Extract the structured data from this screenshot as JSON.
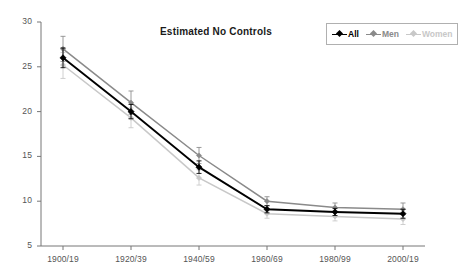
{
  "chart_data": {
    "type": "line",
    "title": "Estimated No Controls",
    "xlabel": "",
    "ylabel": "",
    "categories": [
      "1900/19",
      "1920/39",
      "1940/59",
      "1960/69",
      "1980/99",
      "2000/19"
    ],
    "ylim": [
      5,
      30
    ],
    "yticks": [
      5,
      10,
      15,
      20,
      25,
      30
    ],
    "grid": false,
    "legend_position": "top-right",
    "error_bars": true,
    "series": [
      {
        "name": "All",
        "color": "#000000",
        "values": [
          26.0,
          20.0,
          13.8,
          9.1,
          8.8,
          8.6
        ],
        "err_low": [
          24.9,
          19.2,
          13.1,
          8.7,
          8.4,
          8.1
        ],
        "err_high": [
          27.1,
          20.8,
          14.5,
          9.5,
          9.2,
          9.1
        ]
      },
      {
        "name": "Men",
        "color": "#8a8a8a",
        "values": [
          27.0,
          21.0,
          15.1,
          10.0,
          9.3,
          9.1
        ],
        "err_low": [
          25.6,
          19.7,
          14.2,
          9.5,
          8.8,
          8.5
        ],
        "err_high": [
          28.4,
          22.3,
          16.0,
          10.5,
          9.8,
          9.8
        ]
      },
      {
        "name": "Women",
        "color": "#c8c8c8",
        "values": [
          25.2,
          19.3,
          12.6,
          8.6,
          8.3,
          8.0
        ],
        "err_low": [
          23.7,
          18.2,
          11.8,
          8.1,
          7.8,
          7.4
        ],
        "err_high": [
          26.6,
          20.4,
          13.5,
          9.1,
          8.9,
          8.7
        ]
      }
    ]
  },
  "axes": {
    "yticks": [
      "30",
      "25",
      "20",
      "15",
      "10",
      "5"
    ],
    "xticks": [
      "1900/19",
      "1920/39",
      "1940/59",
      "1960/69",
      "1980/99",
      "2000/19"
    ]
  },
  "legend": {
    "items": [
      {
        "label": "All",
        "color": "#000000"
      },
      {
        "label": "Men",
        "color": "#8a8a8a"
      },
      {
        "label": "Women",
        "color": "#c8c8c8"
      }
    ]
  }
}
